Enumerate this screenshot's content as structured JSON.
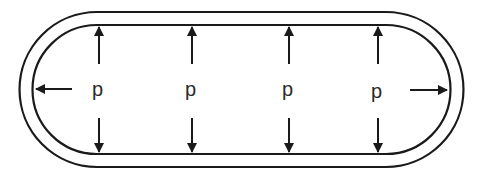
{
  "diagram": {
    "stroke_color": "#1a1a1a",
    "background": "#ffffff",
    "shape": "stadium",
    "walls": [
      "outer-wall",
      "inner-wall"
    ],
    "labels": [
      {
        "id": "p1",
        "text": "p"
      },
      {
        "id": "p2",
        "text": "p"
      },
      {
        "id": "p3",
        "text": "p"
      },
      {
        "id": "p4",
        "text": "p"
      }
    ],
    "arrows": [
      {
        "at": "p1",
        "directions": [
          "up",
          "down",
          "left"
        ]
      },
      {
        "at": "p2",
        "directions": [
          "up",
          "down"
        ]
      },
      {
        "at": "p3",
        "directions": [
          "up",
          "down"
        ]
      },
      {
        "at": "p4",
        "directions": [
          "up",
          "down",
          "right"
        ]
      }
    ]
  }
}
